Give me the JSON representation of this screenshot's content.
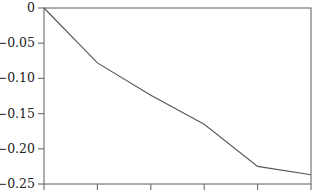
{
  "chart_data": {
    "type": "line",
    "title": "",
    "xlabel": "",
    "ylabel": "",
    "x": [
      0,
      1,
      2,
      3,
      4,
      5
    ],
    "x_tick_labels": [
      "",
      "",
      "",
      "",
      "",
      ""
    ],
    "series": [
      {
        "name": "series-1",
        "values": [
          0,
          -0.078,
          -0.124,
          -0.165,
          -0.225,
          -0.237
        ],
        "color": "#555555"
      }
    ],
    "ylim": [
      -0.25,
      0
    ],
    "y_ticks": [
      0,
      -0.05,
      -0.1,
      -0.15,
      -0.2,
      -0.25
    ],
    "y_tick_labels": [
      "0",
      "−0.05",
      "−0.10",
      "−0.15",
      "−0.20",
      "−0.25"
    ],
    "grid": false,
    "legend": null,
    "frame": "box"
  },
  "style": {
    "axis_color": "#777777",
    "line_color": "#555555"
  }
}
